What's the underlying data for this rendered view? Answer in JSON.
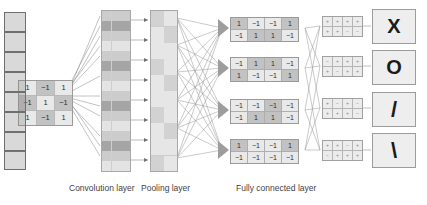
{
  "diagram": {
    "captions": {
      "convolution": "Convolution layer",
      "pooling": "Pooling layer",
      "fully_connected": "Fully connected layer"
    }
  },
  "input": {
    "name": "input-matrix",
    "rows": 3,
    "cols": 3,
    "values": [
      [
        "1",
        "−1",
        "1"
      ],
      [
        "−1",
        "1",
        "−1"
      ],
      [
        "1",
        "−1",
        "1"
      ]
    ]
  },
  "convolution": {
    "name": "convolution-feature-strip",
    "columns": 3,
    "rows": 16,
    "highlight_patches": 8
  },
  "pooling": {
    "name": "pooling-feature-strip",
    "columns": 2,
    "rows": 10
  },
  "fully_connected": {
    "blocks": [
      {
        "id": "fc-block-1",
        "values": [
          [
            "1",
            "−1",
            "−1",
            "1"
          ],
          [
            "−1",
            "1",
            "1",
            "−1"
          ]
        ]
      },
      {
        "id": "fc-block-2",
        "values": [
          [
            "−1",
            "1",
            "1",
            "−1"
          ],
          [
            "1",
            "−1",
            "−1",
            "1"
          ]
        ]
      },
      {
        "id": "fc-block-3",
        "values": [
          [
            "−1",
            "−1",
            "−1",
            "−1"
          ],
          [
            "−1",
            "1",
            "1",
            "−1"
          ]
        ]
      },
      {
        "id": "fc-block-4",
        "values": [
          [
            "1",
            "−1",
            "−1",
            "1"
          ],
          [
            "−1",
            "−1",
            "−1",
            "−1"
          ]
        ]
      }
    ]
  },
  "activation_grids": [
    {
      "id": "mini-1",
      "values": [
        [
          "+",
          "+",
          "+",
          "+"
        ],
        [
          "+",
          "+",
          "−",
          "−"
        ]
      ]
    },
    {
      "id": "mini-2",
      "values": [
        [
          "−",
          "+",
          "+",
          "+"
        ],
        [
          "+",
          "−",
          "+",
          "+"
        ]
      ]
    },
    {
      "id": "mini-3",
      "values": [
        [
          "+",
          "−",
          "+",
          "−"
        ],
        [
          "+",
          "+",
          "+",
          "−"
        ]
      ]
    },
    {
      "id": "mini-4",
      "values": [
        [
          "+",
          "+",
          "−",
          "+"
        ],
        [
          "−",
          "+",
          "+",
          "+"
        ]
      ]
    }
  ],
  "outputs": [
    {
      "id": "output-x",
      "symbol": "X",
      "label": "X"
    },
    {
      "id": "output-o",
      "symbol": "O",
      "label": "O"
    },
    {
      "id": "output-slash",
      "symbol": "/",
      "label": "/"
    },
    {
      "id": "output-backslash",
      "symbol": "\\",
      "label": "\\"
    }
  ],
  "colors": {
    "cell_light": "#e9e9e9",
    "cell_dark": "#c2c2c2",
    "border": "#9a9a9a",
    "line": "#8b8b8b",
    "text": "#2b2b2b"
  }
}
